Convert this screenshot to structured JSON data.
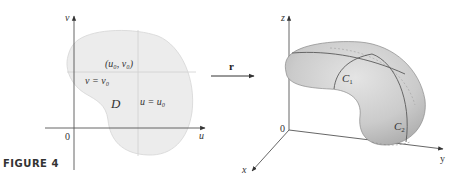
{
  "figure": {
    "caption": "FIGURE 4"
  },
  "left_panel": {
    "v_axis_label": "v",
    "u_axis_label": "u",
    "origin_label": "0",
    "region_label": "D",
    "point_label": "(u₀, v₀)",
    "horizontal_line_label": "v = v₀",
    "vertical_line_label": "u = u₀"
  },
  "mapping": {
    "arrow_label": "r"
  },
  "right_panel": {
    "z_axis_label": "z",
    "y_axis_label": "y",
    "x_axis_label": "x",
    "origin_label": "0",
    "curve1_label": "C",
    "curve1_sub": "1",
    "curve2_label": "C",
    "curve2_sub": "2"
  },
  "colors": {
    "region_fill": "#ececec",
    "surface_fill": "#cfcfcf",
    "axis": "#555555",
    "curve": "#5a5a5a"
  }
}
